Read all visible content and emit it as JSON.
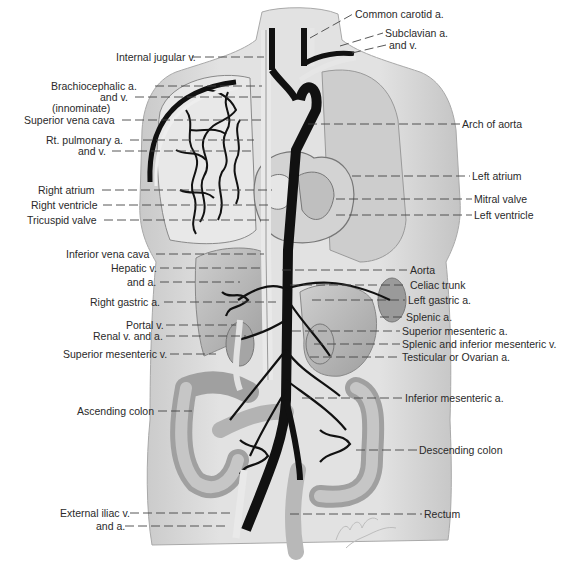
{
  "figure": {
    "colors": {
      "skin": "#d9d9d9",
      "organ": "#bdbdbd",
      "vessel_dark": "#111111",
      "vessel_light": "#e6e6e6",
      "text": "#2a2a2a"
    }
  },
  "labels_left": [
    {
      "id": "internal-jugular-v",
      "text": "Internal jugular v.",
      "x": 116,
      "y": 51,
      "lx2": 264,
      "ly": 57
    },
    {
      "id": "brachiocephalic-a",
      "text": "Brachiocephalic a.",
      "x": 51,
      "y": 80,
      "lx2": 262,
      "ly": 86
    },
    {
      "id": "brachiocephalic-and-v",
      "text": "and v.",
      "x": 100,
      "y": 91,
      "lx2": 262,
      "ly": 97
    },
    {
      "id": "innominate",
      "text": "(innominate)",
      "x": 52,
      "y": 102,
      "lx2": null,
      "ly": null
    },
    {
      "id": "superior-vena-cava",
      "text": "Superior vena cava",
      "x": 24,
      "y": 114,
      "lx2": 264,
      "ly": 120
    },
    {
      "id": "rt-pulmonary-a",
      "text": "Rt. pulmonary a.",
      "x": 46,
      "y": 134,
      "lx2": 254,
      "ly": 140
    },
    {
      "id": "rt-pulmonary-and-v",
      "text": "and v.",
      "x": 78,
      "y": 145,
      "lx2": 254,
      "ly": 151
    },
    {
      "id": "right-atrium",
      "text": "Right atrium",
      "x": 38,
      "y": 184,
      "lx2": 272,
      "ly": 190
    },
    {
      "id": "right-ventricle",
      "text": "Right ventricle",
      "x": 31,
      "y": 199,
      "lx2": 272,
      "ly": 205
    },
    {
      "id": "tricuspid-valve",
      "text": "Tricuspid valve",
      "x": 27,
      "y": 214,
      "lx2": 272,
      "ly": 220
    },
    {
      "id": "inferior-vena-cava",
      "text": "Inferior vena cava",
      "x": 66,
      "y": 248,
      "lx2": 264,
      "ly": 254
    },
    {
      "id": "hepatic-v",
      "text": "Hepatic v.",
      "x": 111,
      "y": 262,
      "lx2": 262,
      "ly": 268
    },
    {
      "id": "hepatic-and-a",
      "text": "and a.",
      "x": 127,
      "y": 276,
      "lx2": 240,
      "ly": 282
    },
    {
      "id": "right-gastric-a",
      "text": "Right gastric a.",
      "x": 90,
      "y": 296,
      "lx2": 276,
      "ly": 302
    },
    {
      "id": "portal-v",
      "text": "Portal v.",
      "x": 126,
      "y": 319,
      "lx2": 236,
      "ly": 325
    },
    {
      "id": "renal-v-and-a",
      "text": "Renal v. and a.",
      "x": 93,
      "y": 330,
      "lx2": 246,
      "ly": 336
    },
    {
      "id": "superior-mesenteric-v",
      "text": "Superior mesenteric v.",
      "x": 63,
      "y": 348,
      "lx2": 216,
      "ly": 354
    },
    {
      "id": "ascending-colon",
      "text": "Ascending colon",
      "x": 77,
      "y": 405,
      "lx2": 192,
      "ly": 411
    },
    {
      "id": "external-iliac-v",
      "text": "External iliac v.",
      "x": 60,
      "y": 507,
      "lx2": 230,
      "ly": 513
    },
    {
      "id": "external-iliac-and-a",
      "text": "and a.",
      "x": 96,
      "y": 520,
      "lx2": 226,
      "ly": 526
    }
  ],
  "labels_right": [
    {
      "id": "common-carotid-a",
      "text": "Common carotid a.",
      "x": 355,
      "y": 8,
      "lx1": 310,
      "ly1": 38,
      "ly": 14
    },
    {
      "id": "subclavian-a",
      "text": "Subclavian a.",
      "x": 385,
      "y": 27,
      "lx1": 340,
      "ly1": 46,
      "ly": 33
    },
    {
      "id": "subclavian-and-v",
      "text": "and v.",
      "x": 389,
      "y": 39,
      "lx1": 352,
      "ly1": 53,
      "ly": 45
    },
    {
      "id": "arch-of-aorta",
      "text": "Arch of aorta",
      "x": 462,
      "y": 118,
      "lx1": 308,
      "ly1": 124,
      "ly": 124
    },
    {
      "id": "left-atrium",
      "text": "Left atrium",
      "x": 472,
      "y": 170,
      "lx1": 352,
      "ly1": 176,
      "ly": 176
    },
    {
      "id": "mitral-valve",
      "text": "Mitral valve",
      "x": 474,
      "y": 193,
      "lx1": 336,
      "ly1": 199,
      "ly": 199
    },
    {
      "id": "left-ventricle",
      "text": "Left ventricle",
      "x": 474,
      "y": 209,
      "lx1": 336,
      "ly1": 215,
      "ly": 215
    },
    {
      "id": "aorta",
      "text": "Aorta",
      "x": 410,
      "y": 264,
      "lx1": 282,
      "ly1": 270,
      "ly": 270
    },
    {
      "id": "celiac-trunk",
      "text": "Celiac trunk",
      "x": 410,
      "y": 279,
      "lx1": 290,
      "ly1": 285,
      "ly": 285
    },
    {
      "id": "left-gastric-a",
      "text": "Left gastric a.",
      "x": 408,
      "y": 294,
      "lx1": 312,
      "ly1": 300,
      "ly": 300
    },
    {
      "id": "splenic-a",
      "text": "Splenic a.",
      "x": 406,
      "y": 311,
      "lx1": 380,
      "ly1": 317,
      "ly": 317
    },
    {
      "id": "superior-mesenteric-a",
      "text": "Superior mesenteric a.",
      "x": 402,
      "y": 325,
      "lx1": 292,
      "ly1": 331,
      "ly": 331
    },
    {
      "id": "splenic-inferior-mesenteric-v",
      "text": "Splenic and inferior mesenteric v.",
      "x": 402,
      "y": 338,
      "lx1": 314,
      "ly1": 344,
      "ly": 344
    },
    {
      "id": "testicular-ovarian-a",
      "text": "Testicular or Ovarian a.",
      "x": 402,
      "y": 351,
      "lx1": 310,
      "ly1": 357,
      "ly": 357
    },
    {
      "id": "inferior-mesenteric-a",
      "text": "Inferior mesenteric a.",
      "x": 405,
      "y": 392,
      "lx1": 302,
      "ly1": 398,
      "ly": 398
    },
    {
      "id": "descending-colon",
      "text": "Descending colon",
      "x": 419,
      "y": 444,
      "lx1": 356,
      "ly1": 450,
      "ly": 450
    },
    {
      "id": "rectum",
      "text": "Rectum",
      "x": 424,
      "y": 508,
      "lx1": 290,
      "ly1": 514,
      "ly": 514
    }
  ],
  "signature": "Netter"
}
